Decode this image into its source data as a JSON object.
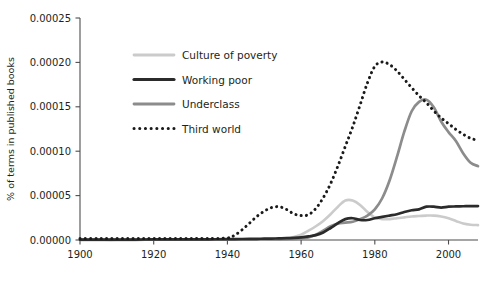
{
  "chart_data": {
    "type": "line",
    "title": "",
    "subtitle": "",
    "xlabel": "",
    "ylabel": "% of terms in published books",
    "xlim": [
      1900,
      2008
    ],
    "ylim": [
      0.0,
      0.00025
    ],
    "grid": false,
    "legend_position": "top-left-inside",
    "xticks": [
      1900,
      1920,
      1940,
      1960,
      1980,
      2000
    ],
    "xtick_labels": [
      "1900",
      "1920",
      "1940",
      "1960",
      "1980",
      "2000"
    ],
    "yticks": [
      0.0,
      5e-05,
      0.0001,
      0.00015,
      0.0002,
      0.00025
    ],
    "ytick_labels": [
      "0.00000",
      "0.00005",
      "0.00010",
      "0.00015",
      "0.00020",
      "0.00025"
    ],
    "x": [
      1900,
      1905,
      1910,
      1915,
      1920,
      1925,
      1930,
      1935,
      1940,
      1942,
      1944,
      1946,
      1948,
      1950,
      1952,
      1954,
      1956,
      1958,
      1960,
      1962,
      1964,
      1966,
      1968,
      1970,
      1972,
      1974,
      1976,
      1978,
      1980,
      1982,
      1984,
      1986,
      1988,
      1990,
      1992,
      1994,
      1996,
      1998,
      2000,
      2002,
      2004,
      2006,
      2008
    ],
    "series": [
      {
        "name": "Culture of poverty",
        "color": "#cbcbcb",
        "style": "solid",
        "linewidth": 2.6,
        "values": [
          2e-07,
          2e-07,
          2e-07,
          3e-07,
          3e-07,
          3e-07,
          4e-07,
          4e-07,
          5e-07,
          5e-07,
          6e-07,
          7e-07,
          8e-07,
          1e-06,
          1.2e-06,
          1.5e-06,
          2e-06,
          3.5e-06,
          6e-06,
          1.05e-05,
          1.55e-05,
          2.15e-05,
          2.9e-05,
          3.75e-05,
          4.45e-05,
          4.45e-05,
          3.95e-05,
          3.15e-05,
          2.55e-05,
          2.35e-05,
          2.35e-05,
          2.45e-05,
          2.55e-05,
          2.65e-05,
          2.7e-05,
          2.75e-05,
          2.75e-05,
          2.65e-05,
          2.45e-05,
          2.15e-05,
          1.85e-05,
          1.72e-05,
          1.68e-05
        ]
      },
      {
        "name": "Working poor",
        "color": "#2b2b2b",
        "style": "solid",
        "linewidth": 2.7,
        "values": [
          4e-07,
          4e-07,
          5e-07,
          5e-07,
          6e-07,
          6e-07,
          7e-07,
          8e-07,
          1e-06,
          1e-06,
          1.1e-06,
          1.2e-06,
          1.3e-06,
          1.5e-06,
          1.6e-06,
          1.8e-06,
          2e-06,
          2.4e-06,
          3e-06,
          4e-06,
          5.5e-06,
          8.5e-06,
          1.35e-05,
          1.9e-05,
          2.35e-05,
          2.45e-05,
          2.25e-05,
          2.25e-05,
          2.45e-05,
          2.6e-05,
          2.75e-05,
          2.9e-05,
          3.15e-05,
          3.35e-05,
          3.45e-05,
          3.75e-05,
          3.75e-05,
          3.65e-05,
          3.75e-05,
          3.78e-05,
          3.8e-05,
          3.82e-05,
          3.82e-05
        ]
      },
      {
        "name": "Underclass",
        "color": "#8c8c8c",
        "style": "solid",
        "linewidth": 2.7,
        "values": [
          2e-07,
          2e-07,
          2e-07,
          2e-07,
          3e-07,
          3e-07,
          3e-07,
          3e-07,
          4e-07,
          4e-07,
          4e-07,
          5e-07,
          5e-07,
          6e-07,
          7e-07,
          8e-07,
          1e-06,
          1.3e-06,
          1.8e-06,
          3e-06,
          6e-06,
          1.05e-05,
          1.55e-05,
          1.85e-05,
          1.95e-05,
          2.05e-05,
          2.35e-05,
          2.75e-05,
          3.45e-05,
          4.7e-05,
          6.7e-05,
          9.35e-05,
          0.000122,
          0.000145,
          0.0001555,
          0.000158,
          0.0001495,
          0.0001335,
          0.0001215,
          0.0001115,
          9.75e-05,
          8.7e-05,
          8.32e-05
        ]
      },
      {
        "name": "Third world",
        "color": "#1a1a1a",
        "style": "dotted",
        "linewidth": 3.0,
        "values": [
          1.8e-06,
          1.8e-06,
          1.8e-06,
          1.8e-06,
          1.8e-06,
          1.8e-06,
          1.8e-06,
          1.8e-06,
          2.2e-06,
          5.5e-06,
          1.15e-05,
          1.9e-05,
          2.65e-05,
          3.25e-05,
          3.65e-05,
          3.75e-05,
          3.45e-05,
          2.95e-05,
          2.75e-05,
          2.85e-05,
          3.55e-05,
          4.75e-05,
          6.35e-05,
          8.35e-05,
          0.0001055,
          0.0001275,
          0.000152,
          0.000177,
          0.0001955,
          0.0002005,
          0.0001975,
          0.0001905,
          0.000181,
          0.0001715,
          0.0001625,
          0.0001545,
          0.0001455,
          0.0001375,
          0.000131,
          0.0001245,
          0.000119,
          0.0001145,
          0.0001122
        ]
      }
    ],
    "legend": [
      {
        "label": "Culture of poverty",
        "color": "#cbcbcb",
        "style": "solid"
      },
      {
        "label": "Working poor",
        "color": "#2b2b2b",
        "style": "solid"
      },
      {
        "label": "Underclass",
        "color": "#8c8c8c",
        "style": "solid"
      },
      {
        "label": "Third world",
        "color": "#1a1a1a",
        "style": "dotted"
      }
    ]
  }
}
